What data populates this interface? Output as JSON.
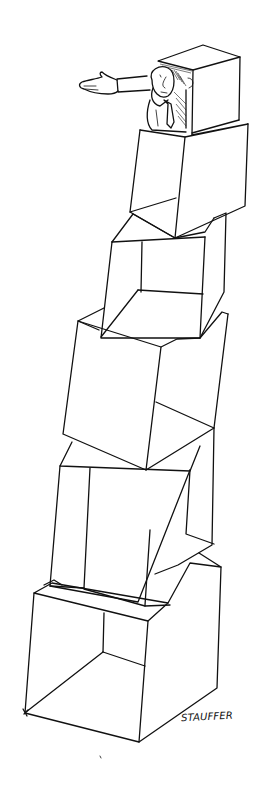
{
  "illustration": {
    "title": "Man peering out of a tower of stacked boxes",
    "style": "black ink line drawing on white",
    "background_color": "#ffffff",
    "ink_color": "#111111",
    "subject": {
      "figure": "man in shirt and tie leaning out of the top box, one hand at his face, other arm outstretched",
      "box_count": 6
    },
    "signature": "STAUFFER"
  }
}
